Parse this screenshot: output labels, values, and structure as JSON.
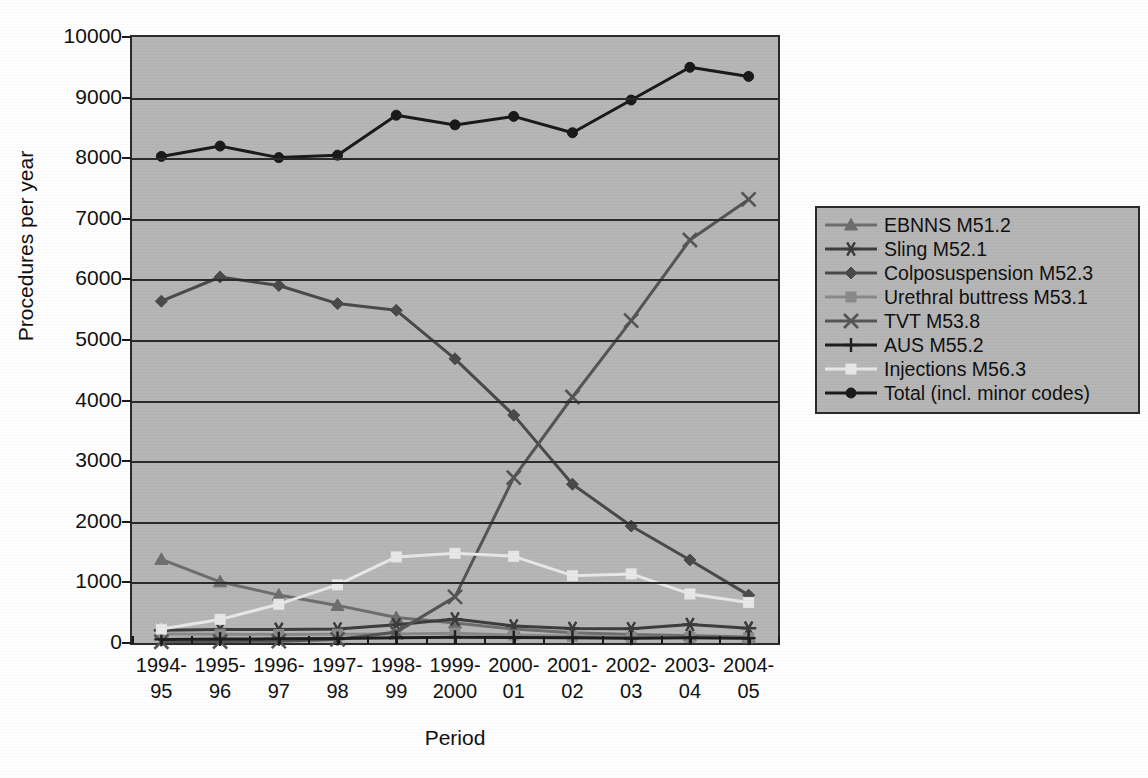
{
  "chart_data": {
    "type": "line",
    "title": "",
    "xlabel": "Period",
    "ylabel": "Procedures per year",
    "ylim": [
      0,
      10000
    ],
    "ytick_step": 1000,
    "yticks": [
      "10000",
      "9000",
      "8000",
      "7000",
      "6000",
      "5000",
      "4000",
      "3000",
      "2000",
      "1000",
      "0"
    ],
    "grid": "horizontal",
    "legend_position": "right",
    "categories": [
      "1994-\n95",
      "1995-\n96",
      "1996-\n97",
      "1997-\n98",
      "1998-\n99",
      "1999-\n2000",
      "2000-\n01",
      "2001-\n02",
      "2002-\n03",
      "2003-\n04",
      "2004-\n05"
    ],
    "categories_line1": [
      "1994-",
      "1995-",
      "1996-",
      "1997-",
      "1998-",
      "1999-",
      "2000-",
      "2001-",
      "2002-",
      "2003-",
      "2004-"
    ],
    "categories_line2": [
      "95",
      "96",
      "97",
      "98",
      "99",
      "2000",
      "01",
      "02",
      "03",
      "04",
      "05"
    ],
    "series": [
      {
        "name": "EBNNS M51.2",
        "marker": "triangle",
        "color": "#6e6e6e",
        "values": [
          1380,
          1010,
          790,
          620,
          420,
          330,
          230,
          170,
          140,
          120,
          100
        ]
      },
      {
        "name": "Sling M52.1",
        "marker": "asterisk",
        "color": "#3d3d3d",
        "values": [
          210,
          225,
          225,
          230,
          300,
          395,
          280,
          240,
          235,
          305,
          245
        ]
      },
      {
        "name": "Colposuspension M52.3",
        "marker": "diamond",
        "color": "#4a4a4a",
        "values": [
          5640,
          6040,
          5900,
          5600,
          5490,
          4690,
          3760,
          2620,
          1930,
          1370,
          790
        ]
      },
      {
        "name": "Urethral buttress M53.1",
        "marker": "square",
        "color": "#8a8a8a",
        "values": [
          150,
          145,
          140,
          145,
          150,
          160,
          130,
          110,
          95,
          90,
          85
        ]
      },
      {
        "name": "TVT M53.8",
        "marker": "cross-x",
        "color": "#555555",
        "values": [
          20,
          25,
          30,
          60,
          180,
          760,
          2730,
          4060,
          5320,
          6650,
          7320
        ]
      },
      {
        "name": "AUS M55.2",
        "marker": "plus",
        "color": "#1f1f1f",
        "values": [
          60,
          65,
          70,
          75,
          85,
          95,
          90,
          85,
          80,
          85,
          80
        ]
      },
      {
        "name": "Injections M56.3",
        "marker": "square",
        "color": "#e8e8e8",
        "values": [
          230,
          390,
          640,
          960,
          1420,
          1480,
          1430,
          1110,
          1140,
          810,
          670
        ]
      },
      {
        "name": "Total (incl. minor codes)",
        "marker": "circle",
        "color": "#1a1a1a",
        "values": [
          8030,
          8200,
          8010,
          8050,
          8710,
          8550,
          8690,
          8420,
          8960,
          9500,
          9350
        ]
      }
    ]
  },
  "legend": {
    "items": [
      "EBNNS M51.2",
      "Sling M52.1",
      "Colposuspension M52.3",
      "Urethral buttress M53.1",
      "TVT M53.8",
      "AUS M55.2",
      "Injections M56.3",
      "Total (incl. minor codes)"
    ]
  },
  "colors": {
    "plot_background": "#b6b6b6",
    "page_background": "#ffffff",
    "axis": "#2b2b2b",
    "text": "#111111"
  }
}
